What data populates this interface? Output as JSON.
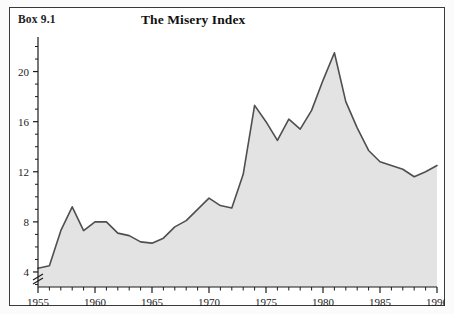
{
  "figure": {
    "box_label": "Box 9.1",
    "title": "The Misery Index",
    "border_color": "#3a3a3a",
    "background_color": "#ffffff"
  },
  "chart_data": {
    "type": "area",
    "title": "The Misery Index",
    "xlabel": "",
    "ylabel": "",
    "xlim": [
      1955,
      1990
    ],
    "ylim": [
      2.8,
      22.6
    ],
    "y_axis_break": true,
    "grid": false,
    "legend": null,
    "line_color": "#4f4f4f",
    "fill_color": "#e3e3e3",
    "y_ticks_major": [
      4,
      8,
      12,
      16,
      20
    ],
    "y_tick_labels": [
      "4",
      "8",
      "12",
      "16",
      "20"
    ],
    "y_tick_minor_step": 1,
    "x_ticks_major": [
      1955,
      1960,
      1965,
      1970,
      1975,
      1980,
      1985,
      1990
    ],
    "x_tick_labels": [
      "1955",
      "1960",
      "1965",
      "1970",
      "1975",
      "1980",
      "1985",
      "1990"
    ],
    "x_tick_minor_step": 1,
    "x": [
      1955,
      1956,
      1957,
      1958,
      1959,
      1960,
      1961,
      1962,
      1963,
      1964,
      1965,
      1966,
      1967,
      1968,
      1969,
      1970,
      1971,
      1972,
      1973,
      1974,
      1975,
      1976,
      1977,
      1978,
      1979,
      1980,
      1981,
      1982,
      1983,
      1984,
      1985,
      1986,
      1987,
      1988,
      1989,
      1990
    ],
    "values": [
      4.3,
      4.5,
      7.3,
      9.2,
      7.3,
      8.0,
      8.0,
      7.1,
      6.9,
      6.4,
      6.3,
      6.7,
      7.6,
      8.1,
      9.0,
      9.9,
      9.3,
      9.1,
      11.8,
      17.3,
      16.0,
      14.5,
      16.2,
      15.4,
      16.9,
      19.3,
      21.5,
      17.6,
      15.5,
      13.7,
      12.8,
      12.5,
      12.2,
      11.6,
      12.0,
      12.5
    ]
  }
}
